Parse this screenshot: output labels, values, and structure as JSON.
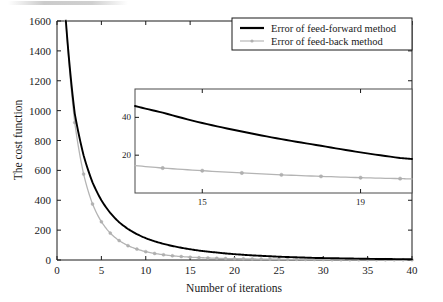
{
  "chart_data": {
    "type": "line",
    "title": "",
    "xlabel": "Number of iterations",
    "ylabel": "The cost function",
    "xlim": [
      0,
      40
    ],
    "ylim": [
      0,
      1600
    ],
    "xticks": [
      0,
      5,
      10,
      15,
      20,
      25,
      30,
      35,
      40
    ],
    "yticks": [
      0,
      200,
      400,
      600,
      800,
      1000,
      1200,
      1400,
      1600
    ],
    "grid": false,
    "legend_position": "top-right",
    "series": [
      {
        "name": "Error of feed-forward method",
        "color": "#000000",
        "marker": "none",
        "x": [
          1,
          2,
          3,
          4,
          5,
          6,
          7,
          8,
          9,
          10,
          11,
          12,
          13,
          14,
          15,
          16,
          17,
          18,
          19,
          20,
          21,
          22,
          23,
          24,
          25,
          26,
          27,
          28,
          29,
          30,
          31,
          32,
          33,
          34,
          35,
          36,
          37,
          38,
          39,
          40
        ],
        "values": [
          1600,
          980,
          700,
          520,
          400,
          315,
          253,
          208,
          173,
          146,
          125,
          108,
          94,
          82,
          72,
          63,
          56,
          50,
          44,
          39,
          35,
          31,
          28,
          25,
          22,
          20,
          18,
          16,
          14,
          13,
          12,
          11,
          10,
          9,
          8,
          7,
          7,
          6,
          6,
          5
        ]
      },
      {
        "name": "Error of feed-back method",
        "color": "#b4b4b4",
        "marker": "dot",
        "x": [
          1,
          2,
          3,
          4,
          5,
          6,
          7,
          8,
          9,
          10,
          11,
          12,
          13,
          14,
          15,
          16,
          17,
          18,
          19,
          20,
          21,
          22,
          23,
          24,
          25,
          26,
          27,
          28,
          29,
          30,
          31,
          32,
          33,
          34,
          35,
          36,
          37,
          38,
          39,
          40
        ],
        "values": [
          1600,
          920,
          575,
          375,
          256,
          180,
          130,
          96,
          73,
          56,
          44,
          35,
          28,
          23,
          19,
          16,
          14,
          12,
          10,
          9,
          8,
          7,
          6,
          5,
          5,
          4,
          4,
          3,
          3,
          3,
          2,
          2,
          2,
          2,
          2,
          1,
          1,
          1,
          1,
          1
        ]
      }
    ],
    "inset": {
      "xlim": [
        13.3,
        20.3
      ],
      "ylim": [
        0,
        55
      ],
      "xticks": [
        15,
        19
      ],
      "yticks": [
        20,
        40
      ],
      "grid": false,
      "series": [
        {
          "name": "Error of feed-forward method",
          "color": "#000000",
          "marker": "none",
          "x": [
            13.3,
            14,
            15,
            16,
            17,
            18,
            19,
            20,
            20.3
          ],
          "values": [
            46,
            42.5,
            37,
            32.5,
            28.5,
            25,
            21.5,
            18.5,
            18
          ]
        },
        {
          "name": "Error of feed-back method",
          "color": "#b4b4b4",
          "marker": "dot",
          "x": [
            13.3,
            14,
            15,
            16,
            17,
            18,
            19,
            20,
            20.3
          ],
          "values": [
            14.5,
            13.2,
            11.8,
            10.6,
            9.6,
            8.8,
            8.1,
            7.6,
            7.4
          ]
        }
      ]
    }
  },
  "axes": {
    "y_label": "The cost function",
    "x_label": "Number of iterations",
    "x_tick_labels": [
      "0",
      "5",
      "10",
      "15",
      "20",
      "25",
      "30",
      "35",
      "40"
    ],
    "y_tick_labels": [
      "0",
      "200",
      "400",
      "600",
      "800",
      "1000",
      "1200",
      "1400",
      "1600"
    ]
  },
  "legend": {
    "items": [
      {
        "label": "Error of feed-forward method",
        "color": "#000000",
        "style": "solid-line"
      },
      {
        "label": "Error of feed-back method",
        "color": "#b4b4b4",
        "style": "line-with-marker"
      }
    ]
  },
  "inset_axes": {
    "x_tick_labels": [
      "15",
      "19"
    ],
    "y_tick_labels": [
      "20",
      "40"
    ]
  }
}
